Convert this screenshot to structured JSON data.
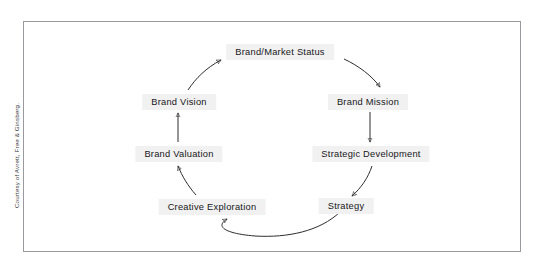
{
  "figure": {
    "credit": "Courtesy of Avrett, Free & Ginsberg.",
    "border_color": "#9a9a9e",
    "background_color": "#ffffff",
    "label_background_color": "#f1f1f1",
    "text_color": "#17171a",
    "arrow_color": "#2d2d2f"
  },
  "diagram": {
    "type": "cycle",
    "direction": "clockwise",
    "node_count": 8,
    "nodes": [
      {
        "id": "brand-market-status",
        "label": "Brand/Market Status",
        "position": "top"
      },
      {
        "id": "brand-mission",
        "label": "Brand Mission",
        "position": "upper-right"
      },
      {
        "id": "strategic-development",
        "label": "Strategic Development",
        "position": "lower-right"
      },
      {
        "id": "strategy",
        "label": "Strategy",
        "position": "bottom-right"
      },
      {
        "id": "creative-exploration",
        "label": "Creative Exploration",
        "position": "bottom-left"
      },
      {
        "id": "brand-valuation",
        "label": "Brand Valuation",
        "position": "lower-left"
      },
      {
        "id": "brand-vision",
        "label": "Brand Vision",
        "position": "upper-left"
      }
    ],
    "edges": [
      {
        "id": "edge-status-to-mission",
        "from": "Brand/Market Status",
        "to": "Brand Mission",
        "style": "curved"
      },
      {
        "id": "edge-mission-to-strategic",
        "from": "Brand Mission",
        "to": "Strategic Development",
        "style": "straight"
      },
      {
        "id": "edge-strategic-to-strategy",
        "from": "Strategic Development",
        "to": "Strategy",
        "style": "curved"
      },
      {
        "id": "edge-strategy-to-creative",
        "from": "Strategy",
        "to": "Creative Exploration",
        "style": "curved"
      },
      {
        "id": "edge-creative-to-valuation",
        "from": "Creative Exploration",
        "to": "Brand Valuation",
        "style": "curved"
      },
      {
        "id": "edge-valuation-to-vision",
        "from": "Brand Valuation",
        "to": "Brand Vision",
        "style": "straight"
      },
      {
        "id": "edge-vision-to-status",
        "from": "Brand Vision",
        "to": "Brand/Market Status",
        "style": "curved"
      }
    ]
  }
}
